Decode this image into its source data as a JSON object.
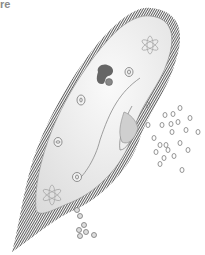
{
  "caption": {
    "text": "re"
  },
  "illustration": {
    "subject": "paramecium",
    "colors": {
      "cilia": "#6a6a6a",
      "body": "#eeeeee",
      "outline": "#777777",
      "nucleus": "#666666",
      "food": "#8a8a8a"
    }
  }
}
